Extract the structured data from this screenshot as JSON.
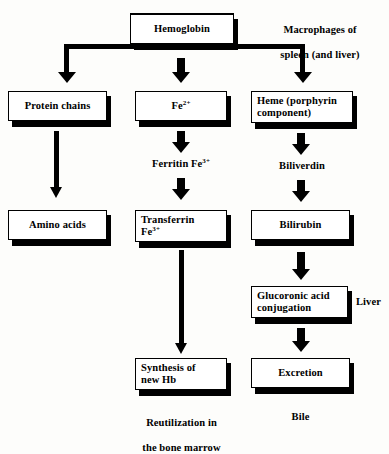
{
  "diagram": {
    "colors": {
      "ink": "#000000",
      "background": "#fdfdfb",
      "box_fill": "#ffffff"
    },
    "nodes": {
      "hemoglobin": "Hemoglobin",
      "protein_chains": "Protein chains",
      "iron2": "Fe",
      "iron2_sup": "2+",
      "heme": "Heme (porphyrin\ncomponent)",
      "heme_line1": "Heme (porphyrin",
      "heme_line2": "component)",
      "amino_acids": "Amino acids",
      "transferrin": "Transferrin",
      "transferrin_sup_base": "Fe",
      "transferrin_sup": "3+",
      "bilirubin": "Bilirubin",
      "glucoronic_line1": "Glucoronic acid",
      "glucoronic_line2": "conjugation",
      "synthesis_line1": "Synthesis of",
      "synthesis_line2": "new Hb",
      "excretion": "Excretion"
    },
    "intermediate_labels": {
      "ferritin_base": "Ferritin Fe",
      "ferritin_sup": "3+",
      "biliverdin": "Biliverdin"
    },
    "annotations": {
      "macrophages_line1": "Macrophages of",
      "macrophages_line2": "spleen (and liver)",
      "liver": "Liver",
      "reutilization_line1": "Reutilization in",
      "reutilization_line2": "the bone marrow",
      "bile": "Bile"
    }
  }
}
